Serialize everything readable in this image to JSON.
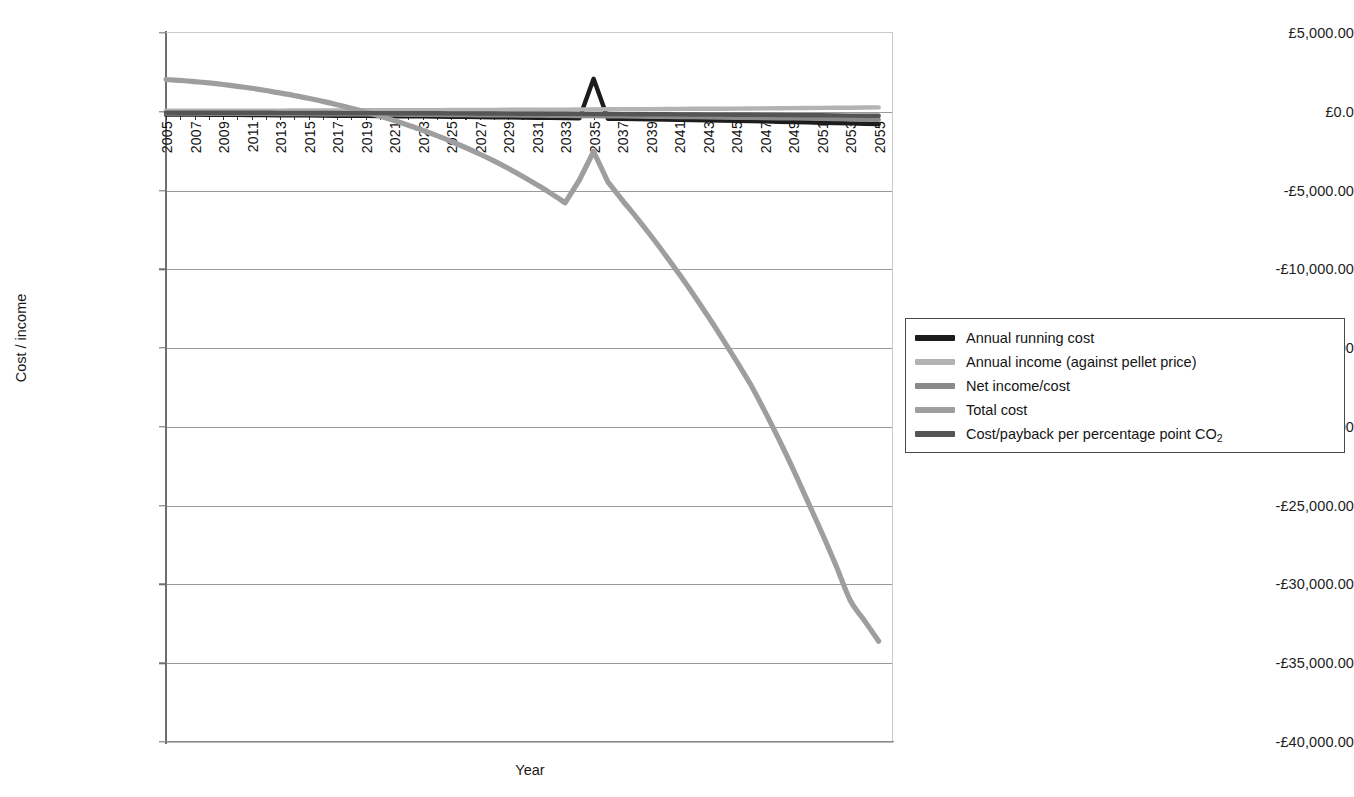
{
  "chart_data": {
    "type": "line",
    "title": "",
    "xlabel": "Year",
    "ylabel": "Cost / income",
    "xlim": [
      2005,
      2056
    ],
    "ylim": [
      -40000,
      5000
    ],
    "grid": true,
    "legend_position": "right",
    "currency": "GBP",
    "y_tick_labels": [
      "£5,000.00",
      "£0.0",
      "-£5,000.00",
      "-£10,000.00",
      "-£15,000.00",
      "-£20,000.00",
      "-£25,000.00",
      "-£30,000.00",
      "-£35,000.00",
      "-£40,000.00"
    ],
    "y_tick_values": [
      5000,
      0,
      -5000,
      -10000,
      -15000,
      -20000,
      -25000,
      -30000,
      -35000,
      -40000
    ],
    "x_tick_labels": [
      "2005",
      "2007",
      "2009",
      "2011",
      "2013",
      "2015",
      "2017",
      "2019",
      "2021",
      "2023",
      "2025",
      "2027",
      "2029",
      "2031",
      "2033",
      "2035",
      "2037",
      "2039",
      "2041",
      "2043",
      "2045",
      "2047",
      "2049",
      "2051",
      "2053",
      "2055"
    ],
    "x_tick_values": [
      2005,
      2007,
      2009,
      2011,
      2013,
      2015,
      2017,
      2019,
      2021,
      2023,
      2025,
      2027,
      2029,
      2031,
      2033,
      2035,
      2037,
      2039,
      2041,
      2043,
      2045,
      2047,
      2049,
      2051,
      2053,
      2055
    ],
    "x": [
      2005,
      2006,
      2007,
      2008,
      2009,
      2010,
      2011,
      2012,
      2013,
      2014,
      2015,
      2016,
      2017,
      2018,
      2019,
      2020,
      2021,
      2022,
      2023,
      2024,
      2025,
      2026,
      2027,
      2028,
      2029,
      2030,
      2031,
      2032,
      2033,
      2034,
      2035,
      2036,
      2037,
      2038,
      2039,
      2040,
      2041,
      2042,
      2043,
      2044,
      2045,
      2046,
      2047,
      2048,
      2049,
      2050,
      2051,
      2052,
      2053,
      2054,
      2055
    ],
    "series": [
      {
        "name": "Annual running cost",
        "color": "#1c1c1c",
        "width": 4.4,
        "values": [
          -170,
          -175,
          -180,
          -186,
          -192,
          -198,
          -204,
          -211,
          -217,
          -224,
          -231,
          -238,
          -246,
          -253,
          -261,
          -269,
          -278,
          -286,
          -295,
          -304,
          -314,
          -324,
          -334,
          -344,
          -355,
          -366,
          -377,
          -389,
          -401,
          -413,
          2100,
          -439,
          -452,
          -466,
          -481,
          -495,
          -511,
          -526,
          -543,
          -559,
          -577,
          -594,
          -613,
          -632,
          -651,
          -671,
          -692,
          -713,
          -735,
          -758,
          -781
        ]
      },
      {
        "name": "Annual income (against pellet price)",
        "color": "#b3b3b3",
        "width": 4.4,
        "values": [
          60,
          62,
          64,
          66,
          68,
          70,
          72,
          74,
          77,
          79,
          81,
          84,
          87,
          89,
          92,
          95,
          98,
          101,
          104,
          107,
          110,
          114,
          117,
          121,
          125,
          129,
          133,
          137,
          141,
          145,
          150,
          155,
          159,
          164,
          170,
          175,
          180,
          186,
          192,
          198,
          204,
          210,
          217,
          224,
          231,
          238,
          245,
          253,
          261,
          269,
          277
        ]
      },
      {
        "name": "Net income/cost",
        "color": "#8a8a8a",
        "width": 4.4,
        "values": [
          -110,
          -113,
          -116,
          -120,
          -124,
          -128,
          -132,
          -137,
          -140,
          -145,
          -150,
          -154,
          -159,
          -164,
          -169,
          -174,
          -180,
          -185,
          -191,
          -197,
          -204,
          -210,
          -217,
          -223,
          -230,
          -237,
          -244,
          -252,
          -260,
          -268,
          -276,
          -284,
          -293,
          -302,
          -311,
          -320,
          -331,
          -340,
          -351,
          -361,
          -373,
          -384,
          -396,
          -408,
          -420,
          -433,
          -447,
          -460,
          -474,
          -489,
          -504
        ]
      },
      {
        "name": "Total cost",
        "color": "#9e9e9e",
        "width": 5.2,
        "values": [
          2050,
          1990,
          1915,
          1830,
          1730,
          1615,
          1490,
          1350,
          1200,
          1035,
          855,
          660,
          450,
          225,
          -15,
          -275,
          -555,
          -850,
          -1170,
          -1510,
          -1875,
          -2265,
          -2680,
          -3120,
          -3590,
          -4090,
          -4620,
          -5180,
          -5780,
          -4330,
          -2520,
          -4450,
          -5600,
          -6700,
          -7850,
          -9050,
          -10300,
          -11600,
          -12950,
          -14350,
          -15800,
          -17300,
          -19000,
          -20800,
          -22700,
          -24700,
          -26700,
          -28800,
          -31000,
          -32300,
          -33600
        ]
      },
      {
        "name": "Cost/payback per percentage point CO₂",
        "color": "#555555",
        "width": 4.4,
        "values": [
          -55,
          -57,
          -58,
          -60,
          -62,
          -64,
          -66,
          -68,
          -70,
          -72,
          -75,
          -77,
          -79,
          -82,
          -85,
          -87,
          -90,
          -93,
          -96,
          -99,
          -102,
          -105,
          -108,
          -112,
          -115,
          -119,
          -123,
          -126,
          -130,
          -134,
          -138,
          -143,
          -147,
          -152,
          -156,
          -161,
          -166,
          -171,
          -177,
          -182,
          -188,
          -194,
          -200,
          -206,
          -213,
          -219,
          -226,
          -233,
          -240,
          -248,
          -255
        ]
      }
    ]
  },
  "legend": {
    "items": [
      {
        "label": "Annual running cost"
      },
      {
        "label": "Annual income (against pellet price)"
      },
      {
        "label": "Net income/cost"
      },
      {
        "label": "Total cost"
      },
      {
        "label": "Cost/payback per percentage point CO"
      }
    ],
    "co2_subscript": "2"
  }
}
